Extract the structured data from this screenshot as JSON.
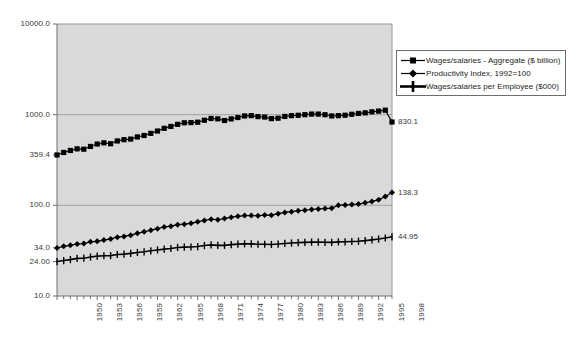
{
  "chart_data": {
    "type": "line",
    "title": "",
    "subtitle": "",
    "xlabel": "",
    "ylabel": "",
    "yscale": "log",
    "ylim": [
      10.0,
      10000.0
    ],
    "grid": true,
    "legend_position": "right-top",
    "y_ticks": [
      "10000.0",
      "1000.0",
      "359.4",
      "100.0",
      "34.0",
      "24.00",
      "10.0"
    ],
    "y_tick_values": [
      10000.0,
      1000.0,
      359.4,
      100.0,
      34.0,
      24.0,
      10.0
    ],
    "x_tick_labels": [
      "1950",
      "1953",
      "1956",
      "1959",
      "1962",
      "1965",
      "1968",
      "1971",
      "1974",
      "1977",
      "1980",
      "1983",
      "1986",
      "1989",
      "1992",
      "1995",
      "1998"
    ],
    "x": [
      1950,
      1951,
      1952,
      1953,
      1954,
      1955,
      1956,
      1957,
      1958,
      1959,
      1960,
      1961,
      1962,
      1963,
      1964,
      1965,
      1966,
      1967,
      1968,
      1969,
      1970,
      1971,
      1972,
      1973,
      1974,
      1975,
      1976,
      1977,
      1978,
      1979,
      1980,
      1981,
      1982,
      1983,
      1984,
      1985,
      1986,
      1987,
      1988,
      1989,
      1990,
      1991,
      1992,
      1993,
      1994,
      1995,
      1996,
      1997,
      1998,
      1999,
      2000
    ],
    "end_labels": [
      {
        "series": "Wages/salaries - Aggregate ($ billion)",
        "value": "830.1"
      },
      {
        "series": "Productivity Index, 1992=100",
        "value": "138.3"
      },
      {
        "series": "Wages/salaries per Employee ($000)",
        "value": "44.95"
      }
    ],
    "series": [
      {
        "name": "Wages/salaries - Aggregate ($ billion)",
        "marker": "square",
        "color": "#000000",
        "values": [
          359.4,
          383,
          403,
          420,
          416,
          446,
          474,
          489,
          478,
          513,
          530,
          538,
          568,
          589,
          622,
          660,
          707,
          742,
          782,
          814,
          818,
          826,
          868,
          908,
          899,
          862,
          898,
          930,
          968,
          975,
          952,
          941,
          905,
          914,
          956,
          976,
          985,
          1000,
          1015,
          1015,
          998,
          968,
          975,
          986,
          1010,
          1032,
          1048,
          1075,
          1095,
          1120,
          830.1
        ]
      },
      {
        "name": "Productivity Index, 1992=100",
        "marker": "diamond",
        "color": "#000000",
        "values": [
          33.8,
          35.3,
          36.2,
          37.5,
          37.9,
          39.6,
          40.1,
          41.4,
          42.6,
          44.6,
          45.4,
          46.9,
          49.1,
          51.0,
          53.2,
          55.3,
          57.7,
          58.9,
          61.2,
          62.0,
          63.3,
          65.8,
          68.1,
          70.2,
          69.4,
          71.4,
          74.0,
          75.6,
          77.1,
          77.1,
          76.6,
          78.2,
          77.9,
          80.9,
          83.5,
          85.1,
          87.4,
          88.3,
          90.0,
          91.3,
          92.0,
          93.1,
          100.0,
          101.0,
          102.0,
          103.5,
          106.5,
          110.5,
          115.0,
          125.0,
          138.3
        ]
      },
      {
        "name": "Wages/salaries per Employee ($000)",
        "marker": "plus",
        "color": "#000000",
        "values": [
          24.0,
          24.6,
          25.2,
          26.0,
          26.1,
          26.9,
          27.5,
          27.8,
          27.9,
          28.7,
          29.0,
          29.5,
          30.2,
          30.7,
          31.5,
          32.2,
          32.9,
          33.4,
          34.3,
          34.6,
          34.7,
          35.1,
          36.0,
          36.6,
          36.2,
          36.2,
          36.9,
          37.3,
          37.6,
          37.6,
          37.2,
          37.2,
          37.0,
          37.4,
          38.0,
          38.4,
          38.8,
          39.0,
          39.3,
          39.3,
          39.1,
          39.0,
          39.5,
          39.6,
          39.9,
          40.2,
          40.8,
          41.6,
          42.5,
          43.6,
          44.95
        ]
      }
    ]
  },
  "legend": {
    "items": [
      {
        "label": "Wages/salaries - Aggregate ($ billion)",
        "marker": "square"
      },
      {
        "label": "Productivity Index, 1992=100",
        "marker": "diamond"
      },
      {
        "label": "Wages/salaries per Employee ($000)",
        "marker": "plus"
      }
    ]
  },
  "colors": {
    "plot_background": "#d9d9d9",
    "series": "#000000",
    "gridline": "#a0a0a0",
    "axis": "#808080",
    "text": "#3a3a3a"
  }
}
